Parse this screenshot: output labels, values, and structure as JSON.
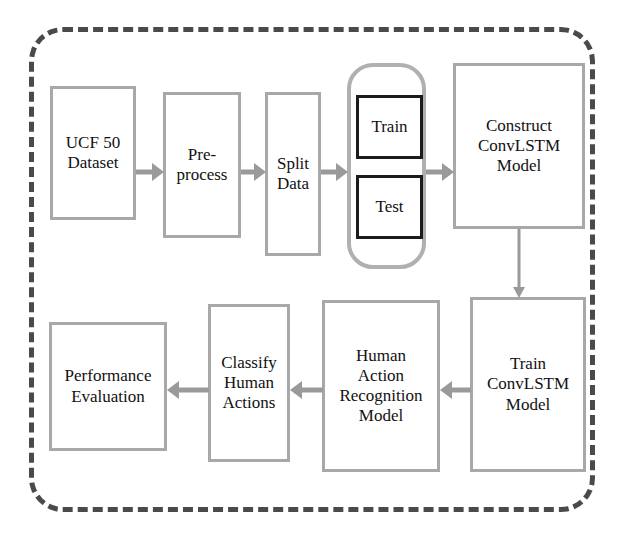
{
  "diagram": {
    "frame": {
      "style": "dashed-rounded-rectangle",
      "color": "#4a4a4a"
    },
    "colors": {
      "box_border": "#a8a8a8",
      "dark_box_border": "#1c1c1c",
      "arrow": "#9a9a9a",
      "frame_dash": "#4a4a4a",
      "text": "#111111",
      "background": "#ffffff"
    },
    "nodes": [
      {
        "id": "dataset",
        "label": "UCF 50\nDataset"
      },
      {
        "id": "preprocess",
        "label": "Pre-\nprocess"
      },
      {
        "id": "split",
        "label": "Split\nData"
      },
      {
        "id": "train_subset",
        "label": "Train"
      },
      {
        "id": "test_subset",
        "label": "Test"
      },
      {
        "id": "construct",
        "label": "Construct\nConvLSTM\nModel"
      },
      {
        "id": "train_model",
        "label": "Train\nConvLSTM\nModel"
      },
      {
        "id": "har_model",
        "label": "Human\nAction\nRecognition\nModel"
      },
      {
        "id": "classify",
        "label": "Classify\nHuman\nActions"
      },
      {
        "id": "performance",
        "label": "Performance\nEvaluation"
      }
    ],
    "edges": [
      {
        "from": "dataset",
        "to": "preprocess",
        "direction": "right"
      },
      {
        "from": "preprocess",
        "to": "split",
        "direction": "right"
      },
      {
        "from": "split",
        "to": "split_group",
        "direction": "right"
      },
      {
        "from": "split_group",
        "to": "construct",
        "direction": "right"
      },
      {
        "from": "construct",
        "to": "train_model",
        "direction": "down"
      },
      {
        "from": "train_model",
        "to": "har_model",
        "direction": "left"
      },
      {
        "from": "har_model",
        "to": "classify",
        "direction": "left"
      },
      {
        "from": "classify",
        "to": "performance",
        "direction": "left"
      }
    ]
  }
}
